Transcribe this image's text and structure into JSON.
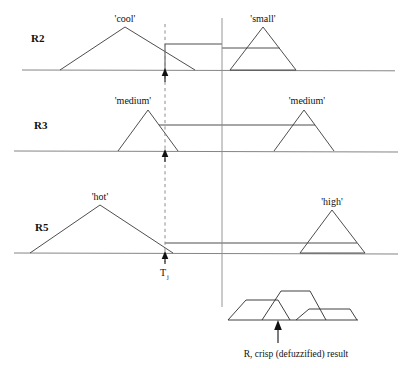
{
  "figure": {
    "title_caption": "R, crisp (defuzzified) result",
    "crisp_marker_label": "T",
    "crisp_marker_subscript": "j",
    "colors": {
      "axis": "#777777",
      "membership_curve": "#3a3a3a",
      "dashed_guide": "#8c8c8c",
      "arrow": "#111111",
      "text": "#111111",
      "background": "#ffffff"
    },
    "rows": [
      {
        "rule_label": "R2",
        "baseline_y": 70,
        "antecedent": {
          "label": "'cool'",
          "label_x": 125,
          "label_y": 22,
          "base_left": 60,
          "apex_x": 125,
          "apex_y": 27,
          "base_right": 195,
          "alpha_cut_y": 44,
          "alpha_cut_right": 222
        },
        "consequent": {
          "label": "'small'",
          "label_x": 263,
          "label_y": 22,
          "base_left": 230,
          "apex_x": 263,
          "apex_y": 27,
          "base_right": 296,
          "alpha_cut_y": 48,
          "alpha_cut_left": 222
        }
      },
      {
        "rule_label": "R3",
        "baseline_y": 151,
        "antecedent": {
          "label": "'medium'",
          "label_x": 130,
          "label_y": 104,
          "base_left": 118,
          "apex_x": 148,
          "apex_y": 110,
          "base_right": 178,
          "alpha_cut_y": 125,
          "alpha_cut_right": 222
        },
        "consequent": {
          "label": "'medium'",
          "label_x": 304,
          "label_y": 104,
          "base_left": 274,
          "apex_x": 304,
          "apex_y": 110,
          "base_right": 334,
          "alpha_cut_y": 125,
          "alpha_cut_left": 222
        }
      },
      {
        "rule_label": "R5",
        "baseline_y": 253,
        "antecedent": {
          "label": "'hot'",
          "label_x": 100,
          "label_y": 200,
          "base_left": 30,
          "apex_x": 100,
          "apex_y": 205,
          "base_right": 173,
          "alpha_cut_y": 243,
          "alpha_cut_right": 222
        },
        "consequent": {
          "label": "'high'",
          "label_x": 332,
          "label_y": 205,
          "base_left": 300,
          "apex_x": 332,
          "apex_y": 210,
          "base_right": 365,
          "alpha_cut_y": 243,
          "alpha_cut_left": 222
        }
      }
    ],
    "vertical_divider": {
      "x": 222,
      "y_top": 18,
      "y_bottom": 307
    },
    "input_guide": {
      "x": 165,
      "y_top": 24,
      "y_bottom": 262
    },
    "input_arrows": [
      {
        "x": 165,
        "tip_y": 70,
        "tail_y": 50
      },
      {
        "x": 165,
        "tip_y": 151,
        "tail_y": 137
      },
      {
        "x": 165,
        "tip_y": 253,
        "tail_y": 239
      }
    ],
    "result": {
      "baseline_y": 320,
      "baseline_left": 228,
      "baseline_right": 358,
      "shapes": [
        {
          "name": "clipped-small",
          "points": "228,320 246,300 278,300 290,320"
        },
        {
          "name": "clipped-medium",
          "points": "262,320 281,291 310,291 326,320"
        },
        {
          "name": "clipped-high",
          "points": "296,320 309,309 350,309 357,320"
        }
      ],
      "crisp_arrow": {
        "x": 278,
        "tip_y": 322,
        "tail_y": 342
      },
      "caption_x": 296,
      "caption_y": 357
    }
  }
}
